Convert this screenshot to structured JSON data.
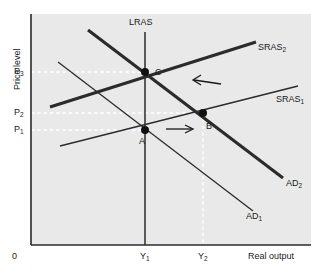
{
  "figure": {
    "type": "economics-diagram",
    "background": "#e9e9e9",
    "page_background": "#ffffff",
    "line_color": "#2b2b2b",
    "dash_color": "#ffffff"
  },
  "axes": {
    "y_title": "Price level",
    "x_title": "Real output",
    "origin_label": "0",
    "y_ticks": [
      {
        "id": "P3",
        "label": "P",
        "sub": "3",
        "y_px": 72
      },
      {
        "id": "P2",
        "label": "P",
        "sub": "2",
        "y_px": 113
      },
      {
        "id": "P1",
        "label": "P",
        "sub": "1",
        "y_px": 130
      }
    ],
    "x_ticks": [
      {
        "id": "Y1",
        "label": "Y",
        "sub": "1",
        "x_px": 145
      },
      {
        "id": "Y2",
        "label": "Y",
        "sub": "2",
        "x_px": 203
      }
    ]
  },
  "curves": [
    {
      "id": "LRAS",
      "label": "LRAS",
      "sub": "",
      "weight": "thin",
      "kind": "vertical"
    },
    {
      "id": "SRAS1",
      "label": "SRAS",
      "sub": "1",
      "weight": "thin",
      "kind": "upward"
    },
    {
      "id": "SRAS2",
      "label": "SRAS",
      "sub": "2",
      "weight": "thick",
      "kind": "upward"
    },
    {
      "id": "AD1",
      "label": "AD",
      "sub": "1",
      "weight": "thin",
      "kind": "downward"
    },
    {
      "id": "AD2",
      "label": "AD",
      "sub": "2",
      "weight": "thick",
      "kind": "downward"
    }
  ],
  "points": [
    {
      "id": "A",
      "label": "A",
      "x_px": 145,
      "y_px": 130,
      "price": "P1",
      "output": "Y1"
    },
    {
      "id": "B",
      "label": "B",
      "x_px": 203,
      "y_px": 113,
      "price": "P2",
      "output": "Y2"
    },
    {
      "id": "C",
      "label": "C",
      "x_px": 145,
      "y_px": 72,
      "price": "P3",
      "output": "Y1"
    }
  ],
  "arrows": [
    {
      "id": "ad-shift-arrow",
      "direction": "right",
      "meaning": "aggregate demand shifts right"
    },
    {
      "id": "sras-shift-arrow",
      "direction": "left",
      "meaning": "short-run aggregate supply shifts left"
    }
  ]
}
